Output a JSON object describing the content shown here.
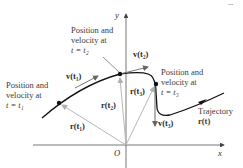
{
  "diagram": {
    "corner_text": "...",
    "axes": {
      "x_label": "x",
      "y_label": "y",
      "origin_label": "O"
    },
    "labels": {
      "t1": {
        "line1": "Position and",
        "line2": "velocity at",
        "line3": "t = t₁"
      },
      "t2": {
        "line1": "Position and",
        "line2": "velocity at",
        "line3": "t = t₂"
      },
      "t3": {
        "line1": "Position and",
        "line2": "velocity at",
        "line3": "t = t₃"
      }
    },
    "vectors": {
      "v1": "v(t₁)",
      "v2": "v(t₂)",
      "v3": "v(t₃)",
      "r1": "r(t₁)",
      "r2": "r(t₂)",
      "r3": "r(t₃)"
    },
    "trajectory": {
      "line1": "Trajectory",
      "line2": "r(t)"
    },
    "colors": {
      "curve": "#111111",
      "position_vectors": "#b8b8b8",
      "velocity_vectors": "#777777",
      "axes": "#555555"
    }
  }
}
